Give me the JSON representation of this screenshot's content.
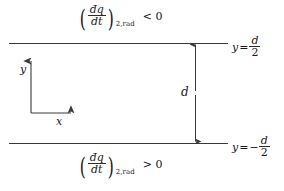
{
  "figure": {
    "name": "parallel-plate-radiative-flux-diagram",
    "background_color": "#ffffff",
    "line_color": "#3a3a3a"
  },
  "plates": {
    "top": {
      "name": "upper-plate",
      "y_position": 43
    },
    "bottom": {
      "name": "lower-plate",
      "y_position": 143
    }
  },
  "flux_labels": {
    "top": {
      "open_paren": "(",
      "numerator": "đq",
      "denominator": "dt",
      "close_paren": ")",
      "subscript": "2,rad",
      "relation": "< 0"
    },
    "bottom": {
      "open_paren": "(",
      "numerator": "đq",
      "denominator": "dt",
      "close_paren": ")",
      "subscript": "2,rad",
      "relation": "> 0"
    }
  },
  "boundary_labels": {
    "top": {
      "variable": "y",
      "equals": "=",
      "sign": "",
      "numerator": "d",
      "denominator": "2"
    },
    "bottom": {
      "variable": "y",
      "equals": "=",
      "sign": "−",
      "numerator": "d",
      "denominator": "2"
    }
  },
  "dimension": {
    "label": "d",
    "arrow": "double-headed-vertical-arrow"
  },
  "axes": {
    "y_label": "y",
    "x_label": "x"
  }
}
